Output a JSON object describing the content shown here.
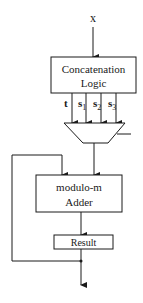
{
  "diagram": {
    "input_label": "x",
    "concat_box": {
      "line1": "Concatenation",
      "line2": "Logic"
    },
    "signals": [
      {
        "name": "t",
        "sub": ""
      },
      {
        "name": "s",
        "sub": "1"
      },
      {
        "name": "s",
        "sub": "2"
      },
      {
        "name": "s",
        "sub": "3"
      }
    ],
    "adder_box": {
      "line1": "modulo-m",
      "line2": "Adder"
    },
    "result_box": {
      "label": "Result"
    },
    "colors": {
      "stroke": "#1a1a1a",
      "background": "#ffffff"
    }
  }
}
